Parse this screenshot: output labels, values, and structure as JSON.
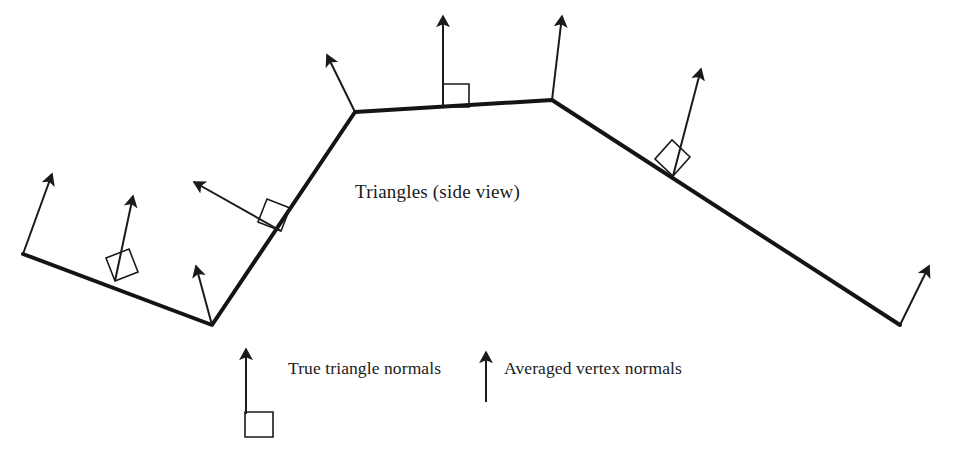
{
  "figure": {
    "background_color": "#ffffff",
    "ink_color": "#1a1a1a",
    "surface_color": "#141414",
    "width": 958,
    "height": 470,
    "caption": "Triangles (side view)"
  },
  "legend": {
    "face_normal_label": "True triangle normals",
    "vertex_normal_label": "Averaged vertex normals",
    "face_sample": {
      "arrow_from": [
        246,
        420
      ],
      "arrow_to": [
        246,
        349
      ],
      "right_angle_square": [
        245,
        412,
        28,
        25
      ]
    },
    "vertex_sample": {
      "arrow_from": [
        486,
        402
      ],
      "arrow_to": [
        486,
        352
      ]
    }
  },
  "chart_data": {
    "type": "diagram",
    "title": "Triangles (side view)",
    "surface_polyline": [
      [
        23,
        254
      ],
      [
        212,
        325
      ],
      [
        355,
        112
      ],
      [
        552,
        100
      ],
      [
        900,
        325
      ]
    ],
    "surface_vertex_labels": [
      "v0",
      "v1",
      "v2",
      "v3",
      "v4"
    ],
    "face_normals": [
      {
        "name": "face-normal-0",
        "from": [
          115,
          281
        ],
        "to": [
          133,
          196
        ],
        "square": [
          [
            115,
            281
          ],
          [
            138,
            272
          ],
          [
            129,
            249
          ],
          [
            106,
            258
          ]
        ]
      },
      {
        "name": "face-normal-1",
        "from": [
          281,
          231
        ],
        "to": [
          194,
          182
        ],
        "square": [
          [
            281,
            231
          ],
          [
            290,
            208
          ],
          [
            267,
            199
          ],
          [
            258,
            222
          ]
        ]
      },
      {
        "name": "face-normal-2",
        "from": [
          443,
          107
        ],
        "to": [
          443,
          16
        ],
        "square": [
          [
            443,
            107
          ],
          [
            443,
            84
          ],
          [
            469,
            84
          ],
          [
            469,
            107
          ]
        ]
      },
      {
        "name": "face-normal-3",
        "from": [
          673,
          176
        ],
        "to": [
          701,
          69
        ],
        "square": [
          [
            673,
            176
          ],
          [
            690,
            157
          ],
          [
            672,
            140
          ],
          [
            655,
            159
          ]
        ]
      }
    ],
    "vertex_normals": [
      {
        "name": "vertex-normal-0",
        "from": [
          23,
          254
        ],
        "to": [
          52,
          174
        ]
      },
      {
        "name": "vertex-normal-1",
        "from": [
          212,
          325
        ],
        "to": [
          196,
          266
        ]
      },
      {
        "name": "vertex-normal-2",
        "from": [
          355,
          112
        ],
        "to": [
          327,
          55
        ]
      },
      {
        "name": "vertex-normal-3",
        "from": [
          552,
          100
        ],
        "to": [
          562,
          16
        ]
      },
      {
        "name": "vertex-normal-4",
        "from": [
          900,
          325
        ],
        "to": [
          929,
          266
        ]
      }
    ],
    "style": {
      "surface_stroke_width": 4,
      "normal_stroke_width": 2,
      "square_stroke_width": 1.6,
      "legend_stroke_width": 2
    }
  }
}
